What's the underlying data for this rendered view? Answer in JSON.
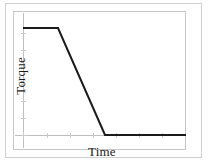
{
  "chart_data": {
    "type": "line",
    "title": "",
    "subtitle": "",
    "xlabel": "Time",
    "ylabel": "Torque",
    "grid": false,
    "legend": null,
    "legend_position": "none",
    "axis_ticks_labeled": false,
    "xlim": [
      0,
      1
    ],
    "ylim": [
      0,
      1
    ],
    "series": [
      {
        "name": "Torque profile",
        "color": "#1a1a1a",
        "line_width": 2,
        "x": [
          0.0,
          0.215,
          0.503,
          1.0
        ],
        "y": [
          0.823,
          0.823,
          0.0,
          0.0
        ],
        "annotations": [
          "constant maximum torque plateau",
          "linear ramp-down",
          "zero torque plateau"
        ]
      }
    ],
    "x_tick_positions": [
      0.0,
      0.15,
      0.3,
      0.45,
      0.6,
      0.75,
      0.9
    ],
    "y_tick_positions": [
      0.0,
      0.17,
      0.34,
      0.5,
      0.66,
      0.83,
      1.0
    ],
    "x_tick_labels": [],
    "y_tick_labels": []
  },
  "figure": {
    "axis_label_x": "Time",
    "axis_label_y": "Torque"
  },
  "colors": {
    "curve": "#1a1a1a",
    "axis": "#b9b9b9",
    "tick": "#c9c9c9",
    "frame": "#c6c6c6",
    "outer_border": "#cfcfcf",
    "background": "#ffffff"
  }
}
